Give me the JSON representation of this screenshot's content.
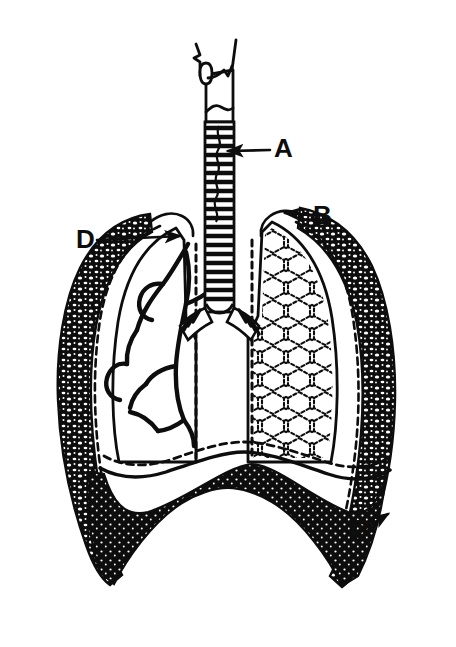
{
  "figure": {
    "background_color": "#ffffff",
    "ink_color": "#0d0d0d",
    "width": 456,
    "height": 647
  },
  "labels": [
    {
      "id": "A",
      "text": "A",
      "x": 274,
      "y": 157,
      "refers_to": "trachea",
      "leader": {
        "from_x": 270,
        "from_y": 150,
        "to_x": 228,
        "to_y": 151,
        "arrow": true
      }
    },
    {
      "id": "B",
      "text": "B",
      "x": 313,
      "y": 224,
      "refers_to": "lung-apex-pleura",
      "leader": {
        "from_x": 309,
        "from_y": 215,
        "to_x": 285,
        "to_y": 213,
        "arrow": true
      }
    },
    {
      "id": "C",
      "text": "C",
      "x": 349,
      "y": 538,
      "refers_to": "diaphragm-costal-margin",
      "leader": {
        "from_x": 366,
        "from_y": 528,
        "to_x": 388,
        "to_y": 516,
        "arrow": true
      }
    },
    {
      "id": "D",
      "text": "D",
      "x": 76,
      "y": 248,
      "refers_to": "bronchus-hilum",
      "leader": {
        "from_x": 97,
        "from_y": 240,
        "to_x": 180,
        "to_y": 236,
        "arrow": true
      }
    }
  ],
  "structures": [
    {
      "name": "larynx",
      "description": "Upper airway box with epiglottis hooks at top of trachea"
    },
    {
      "name": "trachea",
      "description": "Vertical windpipe with stacked cartilage rings"
    },
    {
      "name": "carina",
      "description": "Bifurcation of trachea into main bronchi"
    },
    {
      "name": "bronchial-tree",
      "description": "Branching airways shown in the left-side lung"
    },
    {
      "name": "alveolar-tissue",
      "description": "Honeycomb cellular texture shown in the right-side lung"
    },
    {
      "name": "pleura",
      "description": "Dashed membrane line following the lung surface"
    },
    {
      "name": "chest-wall",
      "description": "Thick stippled band forming the rib cage outline"
    },
    {
      "name": "diaphragm",
      "description": "Dome-shaped muscle at the base of the thorax"
    }
  ]
}
